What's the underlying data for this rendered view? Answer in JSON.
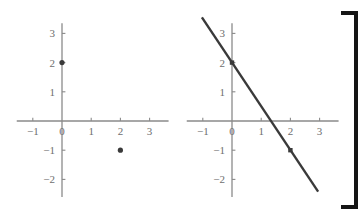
{
  "figure": {
    "title": "",
    "background_color": "#ffffff",
    "axis_color": "#8a8a8a",
    "tick_label_color": "#6e6e6e",
    "data_color": "#3a3a3a",
    "bracket_color": "#151515"
  },
  "bracket": {
    "name": "right-square-bracket",
    "symbol": "]",
    "x_left": 341,
    "x_right": 356,
    "y_top": 13,
    "y_bottom": 207,
    "stroke_width": 4
  },
  "chart_data": [
    {
      "type": "scatter",
      "title": "",
      "xlabel": "",
      "ylabel": "",
      "xlim": [
        -1.55,
        3.65
      ],
      "ylim": [
        -2.6,
        3.35
      ],
      "grid": false,
      "legend": "none",
      "origin_px": {
        "x": 62,
        "y": 121
      },
      "unit_px": 29.2,
      "xticks": [
        -1,
        0,
        1,
        2,
        3
      ],
      "xtick_labels": [
        "−1",
        "0",
        "1",
        "2",
        "3"
      ],
      "yticks": [
        3,
        2,
        1,
        -1,
        -2
      ],
      "ytick_labels": [
        "3",
        "2",
        "1",
        "−1",
        "−2"
      ],
      "points": [
        {
          "x": 0,
          "y": 2,
          "label": "(0, 2)"
        },
        {
          "x": 2,
          "y": -1,
          "label": "(2, -1)"
        }
      ],
      "marker": "filled-circle",
      "marker_radius": 2.6
    },
    {
      "type": "line",
      "title": "",
      "xlabel": "",
      "ylabel": "",
      "xlim": [
        -1.55,
        3.65
      ],
      "ylim": [
        -2.6,
        3.35
      ],
      "grid": false,
      "legend": "none",
      "origin_px": {
        "x": 232,
        "y": 121
      },
      "unit_px": 29.2,
      "xticks": [
        -1,
        0,
        1,
        2,
        3
      ],
      "xtick_labels": [
        "−1",
        "0",
        "1",
        "2",
        "3"
      ],
      "yticks": [
        3,
        2,
        1,
        -1,
        -2
      ],
      "ytick_labels": [
        "3",
        "2",
        "1",
        "−1",
        "−2"
      ],
      "series": [
        {
          "name": "line-through-points",
          "slope": -1.5,
          "intercept": 2,
          "x_start": -1.03,
          "y_start": 3.55,
          "x_end": 2.95,
          "y_end": -2.42,
          "stroke_width": 2.4
        }
      ],
      "points": [
        {
          "x": 0,
          "y": 2,
          "label": "(0, 2)"
        },
        {
          "x": 2,
          "y": -1,
          "label": "(2, -1)"
        }
      ],
      "marker": "filled-square",
      "marker_radius": 2.2
    }
  ]
}
